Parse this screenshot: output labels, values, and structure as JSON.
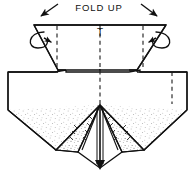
{
  "figure": {
    "title": "FOLD UP",
    "center_mark_label": "T",
    "colors": {
      "ink": "#111111",
      "paper": "#ffffff",
      "stipple": "#6b6b6b",
      "crease": "#222222"
    },
    "annotations": {
      "fold_up_label": "FOLD UP",
      "center_tick_label": "T"
    },
    "arrows": [
      {
        "name": "left-fold-arrow",
        "direction": "down-left"
      },
      {
        "name": "right-fold-arrow",
        "direction": "down-right"
      },
      {
        "name": "left-rotation-curl",
        "direction": "clockwise-loop"
      },
      {
        "name": "right-rotation-curl",
        "direction": "counterclockwise-loop"
      }
    ],
    "crease_lines": [
      {
        "name": "left-flap-crease",
        "style": "dashed"
      },
      {
        "name": "center-crease",
        "style": "dashed"
      },
      {
        "name": "right-flap-crease",
        "style": "dashed"
      },
      {
        "name": "right-body-crease",
        "style": "dashed"
      }
    ],
    "geometry": {
      "top_edge_y": 25,
      "flap_bottom_y": 70,
      "body_shoulder_y": 72,
      "apex_x": 100,
      "apex_y": 105,
      "bottom_point_y": 168
    }
  }
}
